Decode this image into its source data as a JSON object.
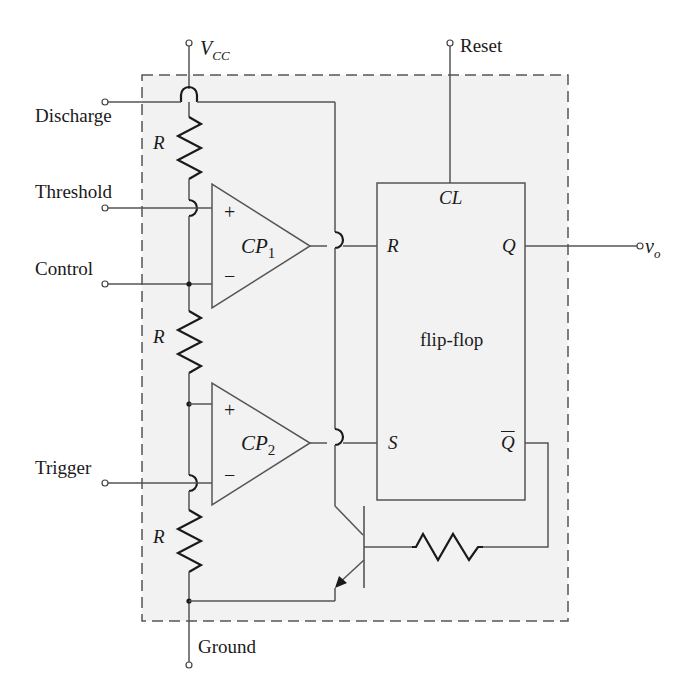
{
  "diagram": {
    "supply_label": "V",
    "supply_subscript": "CC",
    "terminals": {
      "discharge": "Discharge",
      "threshold": "Threshold",
      "control": "Control",
      "trigger": "Trigger",
      "ground": "Ground",
      "reset": "Reset",
      "output": "v",
      "output_subscript": "o"
    },
    "resistors": [
      {
        "label": "R"
      },
      {
        "label": "R"
      },
      {
        "label": "R"
      }
    ],
    "comparators": [
      {
        "name": "CP",
        "index": "1",
        "plus": "+",
        "minus": "−"
      },
      {
        "name": "CP",
        "index": "2",
        "plus": "+",
        "minus": "−"
      }
    ],
    "flipflop": {
      "label": "flip-flop",
      "clear": "CL",
      "reset_input": "R",
      "set_input": "S",
      "q_output": "Q",
      "qbar_output": "Q"
    },
    "colors": {
      "box_fill": "#f2f2f2",
      "line": "#555555",
      "text": "#1a1a1a"
    }
  }
}
